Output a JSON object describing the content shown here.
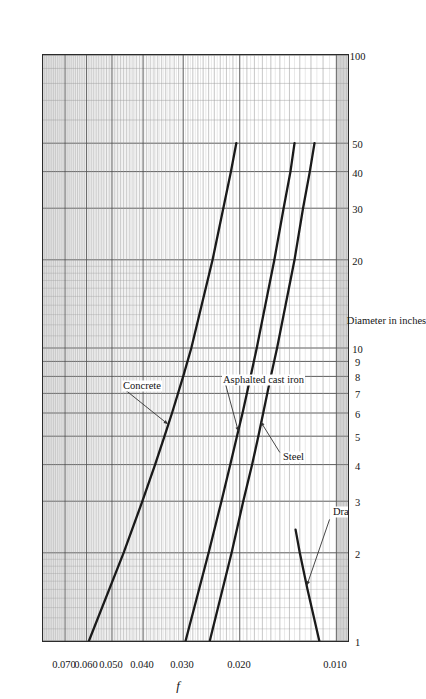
{
  "figure": {
    "orientation": "rotated-90-ccw",
    "background": "#ffffff",
    "ink_color": "#1a1a1a",
    "grid_major_color": "#4a4a4a",
    "grid_minor_color": "#9a9a9a"
  },
  "axes": {
    "x_title": "Diameter in inches",
    "y_title": "f",
    "x_ticks": [
      "1",
      "2",
      "3",
      "4",
      "5",
      "6",
      "7",
      "8",
      "9",
      "10",
      "20",
      "30",
      "40",
      "50",
      "100"
    ],
    "y_ticks": [
      "0.070",
      "0.060",
      "0.050",
      "0.040",
      "0.030",
      "0.020",
      "0.010"
    ]
  },
  "annotations": [
    {
      "name": "concrete-label",
      "text": "Concrete"
    },
    {
      "name": "asphalted-cast-iron-label",
      "text": "Asphalted cast iron"
    },
    {
      "name": "steel-label",
      "text": "Steel"
    },
    {
      "name": "drawn-tubing-label",
      "text": "Drawn tubing"
    }
  ],
  "chart_data": {
    "type": "line",
    "title": "",
    "subtitle": "",
    "xlabel": "Diameter in inches",
    "ylabel": "f",
    "xscale": "log",
    "yscale": "log",
    "xlim": [
      1,
      100
    ],
    "ylim": [
      0.0092,
      0.082
    ],
    "grid": "log-log minor and major gridlines on both axes",
    "legend": "inline callout labels with leader arrows",
    "x_tick_values": [
      1,
      2,
      3,
      4,
      5,
      6,
      7,
      8,
      9,
      10,
      20,
      30,
      40,
      50,
      100
    ],
    "x_tick_labels": [
      "1",
      "2",
      "3",
      "4",
      "5",
      "6",
      "7",
      "8",
      "9",
      "10",
      "20",
      "30",
      "40",
      "50",
      "100"
    ],
    "y_tick_values": [
      0.07,
      0.06,
      0.05,
      0.04,
      0.03,
      0.02,
      0.01
    ],
    "y_tick_labels": [
      "0.070",
      "0.060",
      "0.050",
      "0.040",
      "0.030",
      "0.020",
      "0.010"
    ],
    "series": [
      {
        "name": "Concrete",
        "note": "fully rough friction factor, relative roughness highest",
        "x": [
          1,
          2,
          3,
          4,
          5,
          6,
          8,
          10,
          20,
          30,
          40,
          50
        ],
        "y": [
          0.059,
          0.046,
          0.0402,
          0.0367,
          0.0343,
          0.0325,
          0.03,
          0.0283,
          0.0243,
          0.0225,
          0.0213,
          0.0205
        ]
      },
      {
        "name": "Asphalted cast iron",
        "x": [
          1,
          2,
          3,
          4,
          5,
          6,
          8,
          10,
          20,
          30,
          40,
          50
        ],
        "y": [
          0.0295,
          0.025,
          0.0228,
          0.0214,
          0.0204,
          0.0196,
          0.0185,
          0.0177,
          0.0156,
          0.0146,
          0.0139,
          0.0135
        ]
      },
      {
        "name": "Steel",
        "x": [
          1,
          2,
          3,
          4,
          5,
          6,
          8,
          10,
          20,
          30,
          40,
          50
        ],
        "y": [
          0.0248,
          0.0212,
          0.0195,
          0.0183,
          0.0175,
          0.0169,
          0.016,
          0.0153,
          0.0135,
          0.0127,
          0.0121,
          0.0117
        ]
      },
      {
        "name": "Drawn tubing",
        "x": [
          1,
          1.5,
          2,
          2.4
        ],
        "y": [
          0.0113,
          0.0123,
          0.013,
          0.0134
        ]
      }
    ]
  }
}
